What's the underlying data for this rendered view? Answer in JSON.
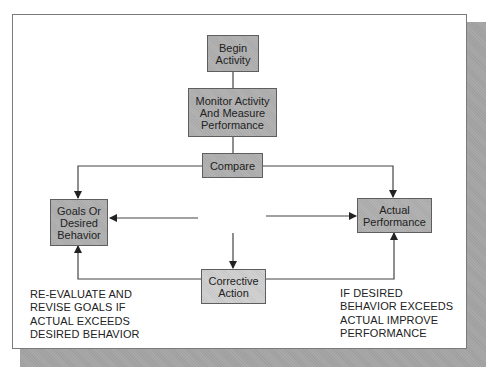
{
  "diagram": {
    "type": "flowchart",
    "nodes": {
      "begin": {
        "label": "Begin\nActivity"
      },
      "monitor": {
        "label": "Monitor Activity\nAnd Measure\nPerformance"
      },
      "compare": {
        "label": "Compare"
      },
      "goals": {
        "label": "Goals Or\nDesired\nBehavior"
      },
      "actual": {
        "label": "Actual\nPerformance"
      },
      "corrective": {
        "label": "Corrective\nAction"
      }
    },
    "notes": {
      "left": "RE-EVALUATE AND\nREVISE GOALS IF\nACTUAL EXCEEDS\nDESIRED BEHAVIOR",
      "right": "IF DESIRED\nBEHAVIOR EXCEEDS\nACTUAL IMPROVE\nPERFORMANCE"
    },
    "edges": [
      {
        "from": "begin",
        "to": "monitor"
      },
      {
        "from": "monitor",
        "to": "compare"
      },
      {
        "from": "compare",
        "to": "goals"
      },
      {
        "from": "compare",
        "to": "actual"
      },
      {
        "from": "center",
        "to": "goals"
      },
      {
        "from": "center",
        "to": "actual"
      },
      {
        "from": "center",
        "to": "corrective"
      },
      {
        "from": "corrective",
        "to": "goals"
      },
      {
        "from": "corrective",
        "to": "actual"
      }
    ],
    "colors": {
      "node_fill": "#b3b3b3",
      "corrective_fill": "#d2d2d2",
      "line": "#333333",
      "shadow": "#a9a9a9"
    }
  }
}
